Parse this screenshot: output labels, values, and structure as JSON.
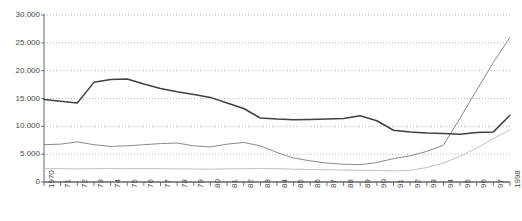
{
  "chart_data": {
    "type": "line",
    "title": "",
    "xlabel": "",
    "ylabel": "",
    "grid": true,
    "legend": "none",
    "ylim": [
      0,
      30000
    ],
    "ytick_labels": [
      "0",
      "5.000",
      "10.000",
      "15.000",
      "20.000",
      "25.000",
      "30.000"
    ],
    "ytick_values": [
      0,
      5000,
      10000,
      15000,
      20000,
      25000,
      30000
    ],
    "categories": [
      "1970",
      "71",
      "72",
      "73",
      "74",
      "75",
      "76",
      "77",
      "78",
      "79",
      "80",
      "81",
      "82",
      "83",
      "84",
      "85",
      "86",
      "87",
      "88",
      "89",
      "90",
      "91",
      "92",
      "93",
      "94",
      "95",
      "96",
      "97",
      "1998"
    ],
    "series": [
      {
        "name": "series-1",
        "color": "#404040",
        "values": [
          14800,
          14500,
          14200,
          17900,
          18400,
          18500,
          17600,
          16800,
          16200,
          15700,
          15200,
          14200,
          13200,
          11500,
          11300,
          11200,
          11250,
          11300,
          11400,
          11900,
          11000,
          9300,
          9000,
          8800,
          8700,
          8600,
          8900,
          9000,
          12000
        ]
      },
      {
        "name": "series-2",
        "color": "#8a8a8a",
        "values": [
          6700,
          6800,
          7200,
          6700,
          6400,
          6500,
          6700,
          6900,
          7000,
          6500,
          6300,
          6800,
          7100,
          6500,
          5300,
          4300,
          3800,
          3400,
          3200,
          3100,
          3500,
          4200,
          4700,
          5500,
          6600,
          11500,
          16500,
          21500,
          26000
        ]
      },
      {
        "name": "series-3",
        "color": "#c0c0c0",
        "values": [
          2400,
          2400,
          2350,
          2400,
          2400,
          2400,
          2400,
          2400,
          2350,
          2350,
          2300,
          2350,
          2400,
          2400,
          2400,
          2300,
          2250,
          2200,
          2150,
          2100,
          2050,
          2000,
          2100,
          2600,
          3400,
          4600,
          6100,
          7800,
          9400
        ]
      }
    ]
  }
}
